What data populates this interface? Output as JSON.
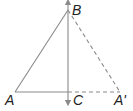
{
  "diagram": {
    "type": "geometry-reflection",
    "points": {
      "A": {
        "label": "A",
        "x": 15,
        "y": 92
      },
      "B": {
        "label": "B",
        "x": 68,
        "y": 10
      },
      "C": {
        "label": "C",
        "x": 68,
        "y": 92
      },
      "A_prime": {
        "label": "A'",
        "x": 120,
        "y": 92
      }
    },
    "segments": [
      {
        "from": "A",
        "to": "B",
        "style": "solid"
      },
      {
        "from": "A",
        "to": "C",
        "style": "solid"
      },
      {
        "from": "B",
        "to": "A_prime",
        "style": "dashed"
      },
      {
        "from": "C",
        "to": "A_prime",
        "style": "dashed"
      }
    ],
    "axis": {
      "name": "line BC",
      "style": "solid",
      "arrows": "both"
    },
    "colors": {
      "line": "#8a8a8a",
      "label": "#222222"
    }
  }
}
